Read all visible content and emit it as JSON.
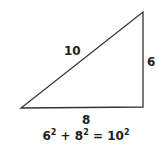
{
  "diagram": {
    "type": "right-triangle",
    "sides": {
      "hypotenuse": "10",
      "vertical": "6",
      "horizontal": "8"
    },
    "equation": {
      "a": "6",
      "b": "8",
      "c": "10",
      "exp": "2",
      "plus": "+",
      "equals": "="
    },
    "colors": {
      "stroke": "#333333",
      "text": "#222222"
    }
  }
}
